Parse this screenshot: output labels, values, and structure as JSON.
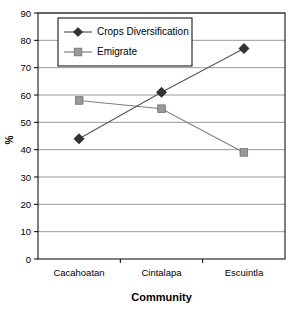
{
  "chart_data": {
    "type": "line",
    "title": "",
    "subtitle": "",
    "xlabel": "Community",
    "ylabel": "%",
    "categories": [
      "Cacahoatan",
      "Cintalapa",
      "Escuintla"
    ],
    "series": [
      {
        "name": "Crops Diversification",
        "values": [
          44,
          61,
          77
        ],
        "marker": "diamond",
        "color": "#333333",
        "line_color": "#595959"
      },
      {
        "name": "Emigrate",
        "values": [
          58,
          55,
          39
        ],
        "marker": "square",
        "color": "#999999",
        "line_color": "#808080"
      }
    ],
    "ylim": [
      0,
      90
    ],
    "ytick_step": 10,
    "yticks": [
      0,
      10,
      20,
      30,
      40,
      50,
      60,
      70,
      80,
      90
    ],
    "grid": "horizontal",
    "legend_position": "top-left-inside",
    "annotations": []
  },
  "colors": {
    "background": "#ffffff",
    "gridline": "#808080",
    "frame": "#000000",
    "text": "#000000"
  }
}
